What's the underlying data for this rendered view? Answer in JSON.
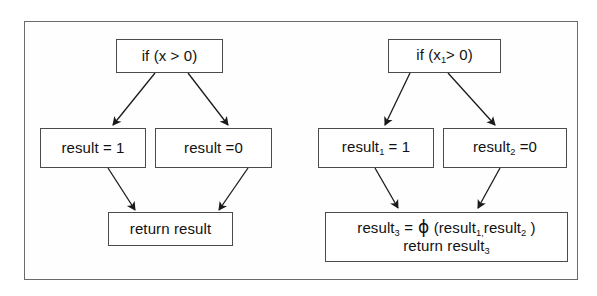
{
  "figure": {
    "title": "",
    "frame_color": "#6a6a6a",
    "node_border_color": "#4b4b4b",
    "background_color": "#ffffff",
    "arrow_color": "#1a1a1a"
  },
  "left_graph": {
    "name": "original-code-cfg",
    "nodes": {
      "condition": {
        "text": "if (x > 0)"
      },
      "then_branch": {
        "text": "result = 1"
      },
      "else_branch": {
        "text": "result =0"
      },
      "join": {
        "text": "return result"
      }
    },
    "edges": [
      {
        "from": "condition",
        "to": "then_branch"
      },
      {
        "from": "condition",
        "to": "else_branch"
      },
      {
        "from": "then_branch",
        "to": "join"
      },
      {
        "from": "else_branch",
        "to": "join"
      }
    ]
  },
  "right_graph": {
    "name": "ssa-form-cfg",
    "nodes": {
      "condition": {
        "prefix": "if (x",
        "subscript": "1",
        "suffix": "> 0)"
      },
      "then_branch": {
        "prefix": "result",
        "subscript": "1",
        "suffix": " = 1"
      },
      "else_branch": {
        "prefix": "result",
        "subscript": "2",
        "suffix": " =0"
      },
      "join": {
        "line1": {
          "p1": "result",
          "s1": "3",
          "p2": " = ",
          "phi": "ϕ",
          "p3": " (result",
          "s2": "1,",
          "p4": "result",
          "s3": "2",
          "p5": " )"
        },
        "line2": {
          "p1": "return result",
          "s1": "3"
        }
      }
    },
    "edges": [
      {
        "from": "condition",
        "to": "then_branch"
      },
      {
        "from": "condition",
        "to": "else_branch"
      },
      {
        "from": "then_branch",
        "to": "join"
      },
      {
        "from": "else_branch",
        "to": "join"
      }
    ]
  }
}
